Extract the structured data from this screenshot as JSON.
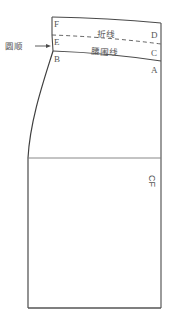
{
  "diagram": {
    "type": "skirt-front-pattern-draft",
    "colors": {
      "line": "#4a4a4a",
      "thin_line": "#7a7a7a",
      "text": "#555555",
      "background": "#ffffff"
    },
    "points": {
      "F": "F",
      "E": "E",
      "B": "B",
      "D": "D",
      "C": "C",
      "A": "A"
    },
    "labels": {
      "fold_line": "折线",
      "waistline": "腰围线",
      "smooth_curve": "圆顺",
      "center_front": "CF"
    }
  }
}
